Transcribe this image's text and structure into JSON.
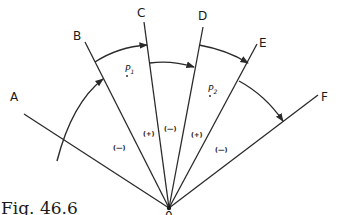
{
  "figure": {
    "caption": "Fig. 46.6",
    "origin_label": "0",
    "colors": {
      "ink": "#2a2a2a",
      "background": "#ffffff"
    },
    "rays": [
      {
        "id": "A",
        "label": "A"
      },
      {
        "id": "B",
        "label": "B"
      },
      {
        "id": "C",
        "label": "C"
      },
      {
        "id": "D",
        "label": "D"
      },
      {
        "id": "E",
        "label": "E"
      },
      {
        "id": "F",
        "label": "F"
      }
    ],
    "regions": [
      {
        "between": "A-B",
        "sign": "(—)"
      },
      {
        "between": "B-C",
        "sign": "(+)"
      },
      {
        "between": "C-D",
        "sign": "(—)"
      },
      {
        "between": "D-E",
        "sign": "(+)"
      },
      {
        "between": "E-F",
        "sign": "(—)"
      }
    ],
    "points": [
      {
        "label": "P",
        "subscript": "1"
      },
      {
        "label": "P",
        "subscript": "2"
      }
    ],
    "arcs": [
      {
        "from": "A",
        "to": "B"
      },
      {
        "from": "B",
        "to": "C"
      },
      {
        "from": "C",
        "to": "D"
      },
      {
        "from": "D",
        "to": "E"
      },
      {
        "from": "E",
        "to": "F"
      }
    ]
  }
}
